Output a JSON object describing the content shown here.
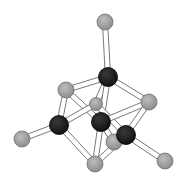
{
  "diagram": {
    "type": "ball-and-stick molecular structure",
    "colors": {
      "dark_atom": "#1c1c1c",
      "light_atom": "#a6a6a6",
      "bond_fill": "#ffffff",
      "bond_edge": "#6a6a6a"
    },
    "atoms": [
      {
        "id": "g1",
        "kind": "light",
        "x": 105,
        "y": 22,
        "r": 8
      },
      {
        "id": "b1",
        "kind": "dark",
        "x": 108,
        "y": 77,
        "r": 9.5
      },
      {
        "id": "g2",
        "kind": "light",
        "x": 66,
        "y": 90,
        "r": 8
      },
      {
        "id": "g3",
        "kind": "light",
        "x": 149,
        "y": 102,
        "r": 8
      },
      {
        "id": "g4",
        "kind": "light",
        "x": 96,
        "y": 104,
        "r": 6.5
      },
      {
        "id": "b2",
        "kind": "dark",
        "x": 101,
        "y": 122,
        "r": 9.5
      },
      {
        "id": "b3",
        "kind": "dark",
        "x": 59,
        "y": 125,
        "r": 9.5
      },
      {
        "id": "b4",
        "kind": "dark",
        "x": 126,
        "y": 135,
        "r": 9.5
      },
      {
        "id": "g5",
        "kind": "light",
        "x": 114,
        "y": 142,
        "r": 8
      },
      {
        "id": "g6",
        "kind": "light",
        "x": 22,
        "y": 139,
        "r": 8
      },
      {
        "id": "g7",
        "kind": "light",
        "x": 95,
        "y": 164,
        "r": 8
      },
      {
        "id": "g8",
        "kind": "light",
        "x": 165,
        "y": 161,
        "r": 8
      }
    ],
    "bonds": [
      [
        "g1",
        "b1"
      ],
      [
        "b1",
        "g2"
      ],
      [
        "b1",
        "g3"
      ],
      [
        "b1",
        "g4"
      ],
      [
        "b1",
        "b2"
      ],
      [
        "g2",
        "b3"
      ],
      [
        "g2",
        "b2"
      ],
      [
        "g4",
        "b3"
      ],
      [
        "g4",
        "b4"
      ],
      [
        "b2",
        "g3"
      ],
      [
        "b2",
        "g7"
      ],
      [
        "b2",
        "g5"
      ],
      [
        "g3",
        "b4"
      ],
      [
        "b3",
        "g6"
      ],
      [
        "b3",
        "g7"
      ],
      [
        "b4",
        "g7"
      ],
      [
        "b4",
        "g8"
      ]
    ]
  }
}
